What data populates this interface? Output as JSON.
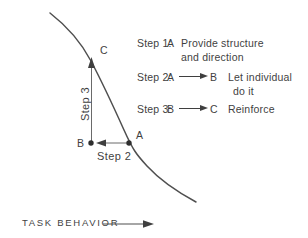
{
  "colors": {
    "ink": "#3f3f3f",
    "thin_line": "#6a6a6a",
    "curve": "#4f4f4f",
    "background": "#ffffff"
  },
  "curve_points": {
    "c": "C",
    "a": "A",
    "b": "B"
  },
  "annotations": {
    "step3_vertical": "Step 3",
    "step2_horizontal": "Step 2"
  },
  "axis": {
    "x_label": "TASK BEHAVIOR"
  },
  "legend": {
    "rows": [
      {
        "step": "Step 1:",
        "from": "A",
        "to": "",
        "line1": "Provide structure",
        "line2": "and direction"
      },
      {
        "step": "Step 2:",
        "from": "A",
        "to": "B",
        "line1": "Let individual",
        "line2": "do it"
      },
      {
        "step": "Step 3:",
        "from": "B",
        "to": "C",
        "line1": "Reinforce",
        "line2": ""
      }
    ]
  }
}
